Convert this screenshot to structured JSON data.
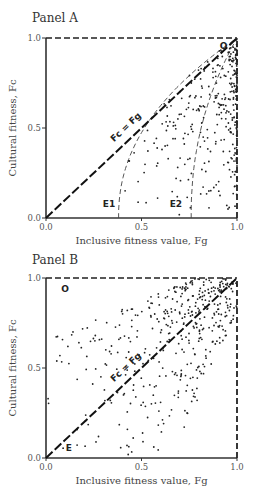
{
  "chart_data": [
    {
      "type": "scatter",
      "title": "Panel A",
      "xlabel": "Inclusive fitness value, Fg",
      "ylabel": "Cultural fitness, Fc",
      "xlim": [
        0.0,
        1.0
      ],
      "ylim": [
        0.0,
        1.0
      ],
      "x_ticks": [
        "0.0",
        "0.5",
        "1.0"
      ],
      "y_ticks": [
        "0.0",
        "0.5",
        "1.0"
      ],
      "grid": false,
      "reference_line": {
        "label": "Fc = Fg",
        "from": [
          0.0,
          0.0
        ],
        "to": [
          1.0,
          1.0
        ]
      },
      "boundary_curves": [
        {
          "name": "E1",
          "x_intercept": 0.38,
          "endpoint": [
            1.0,
            1.0
          ]
        },
        {
          "name": "E2",
          "x_intercept": 0.76,
          "endpoint": [
            1.0,
            1.0
          ]
        }
      ],
      "annotations": [
        {
          "text": "O",
          "x": 0.93,
          "y": 0.94
        },
        {
          "text": "E1",
          "x": 0.33,
          "y": 0.06
        },
        {
          "text": "E2",
          "x": 0.68,
          "y": 0.06
        }
      ],
      "point_distribution": "dense near (1.0, 1.0) and along Fg = 1.0; scattered below curve E1, x > 0.38",
      "n_points_approx": 320
    },
    {
      "type": "scatter",
      "title": "Panel B",
      "xlabel": "Inclusive fitness value, Fg",
      "ylabel": "Cultural fitness, Fc",
      "xlim": [
        0.0,
        1.0
      ],
      "ylim": [
        0.0,
        1.0
      ],
      "x_ticks": [
        "0.0",
        "0.5",
        "1.0"
      ],
      "y_ticks": [
        "0.0",
        "0.5",
        "1.0"
      ],
      "grid": false,
      "reference_line": {
        "label": "Fc = Fg",
        "from": [
          0.0,
          0.0
        ],
        "to": [
          1.0,
          1.0
        ]
      },
      "annotations": [
        {
          "text": "O",
          "x": 0.1,
          "y": 0.92
        },
        {
          "text": "E",
          "x": 0.12,
          "y": 0.04
        }
      ],
      "point_distribution": "scattered over whole square, densest near (1.0, 1.0) along diagonal",
      "n_points_approx": 420
    }
  ]
}
